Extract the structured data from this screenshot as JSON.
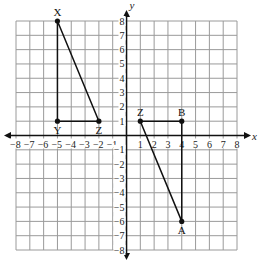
{
  "diagram": {
    "type": "coordinate-plane",
    "x_axis": {
      "label": "x",
      "min": -8,
      "max": 8,
      "ticks": [
        -8,
        -7,
        -6,
        -5,
        -4,
        -3,
        -2,
        -1,
        1,
        2,
        3,
        4,
        5,
        6,
        7,
        8
      ]
    },
    "y_axis": {
      "label": "y",
      "min": -8,
      "max": 8,
      "ticks": [
        8,
        7,
        6,
        5,
        4,
        3,
        2,
        1,
        -1,
        -2,
        -3,
        -4,
        -5,
        -6,
        -7,
        -8
      ]
    },
    "grid": true,
    "colors": {
      "grid": "#9a9a9a",
      "axis": "#111111",
      "shape": "#111111"
    },
    "shapes": [
      {
        "name": "triangle-XYZ",
        "vertices": [
          {
            "label": "X",
            "x": -5,
            "y": 8
          },
          {
            "label": "Y",
            "x": -5,
            "y": 1
          },
          {
            "label": "Z",
            "x": -2,
            "y": 1
          }
        ]
      },
      {
        "name": "triangle-ZBA",
        "vertices": [
          {
            "label": "Z",
            "x": 1,
            "y": 1
          },
          {
            "label": "B",
            "x": 4,
            "y": 1
          },
          {
            "label": "A",
            "x": 4,
            "y": -6
          }
        ]
      }
    ]
  }
}
